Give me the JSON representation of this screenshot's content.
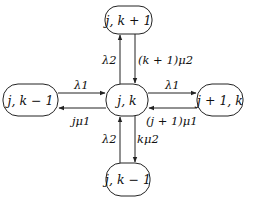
{
  "diagram": {
    "type": "state-transition",
    "nodes": {
      "center": {
        "label": "j, k"
      },
      "top": {
        "label": "j, k + 1"
      },
      "left": {
        "label": "j, k − 1"
      },
      "right": {
        "label": "j + 1, k"
      },
      "bottom": {
        "label": "j, k − 1"
      }
    },
    "edges": {
      "center_to_top": {
        "label": "λ2"
      },
      "top_to_center": {
        "label": "(k + 1)μ2"
      },
      "left_to_center": {
        "label": "λ1"
      },
      "center_to_left": {
        "label": "jμ1"
      },
      "center_to_right": {
        "label": "λ1"
      },
      "right_to_center": {
        "label": "(j + 1)μ1"
      },
      "bottom_to_center": {
        "label": "λ2"
      },
      "center_to_bottom": {
        "label": "kμ2"
      }
    },
    "colors": {
      "stroke": "#222222",
      "background": "#ffffff",
      "text": "#111111"
    }
  }
}
